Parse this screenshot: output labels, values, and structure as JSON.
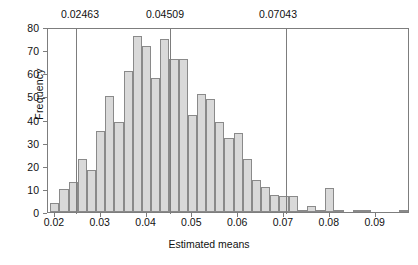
{
  "chart_data": {
    "type": "bar",
    "title": "",
    "xlabel": "Estimated means",
    "ylabel": "Frequency",
    "xlim": [
      0.0185,
      0.0975
    ],
    "ylim": [
      0,
      80
    ],
    "grid": false,
    "legend": null,
    "bin_width": 0.002,
    "x_ticks": [
      "0.02",
      "0.03",
      "0.04",
      "0.05",
      "0.06",
      "0.07",
      "0.08",
      "0.09"
    ],
    "x_tick_values": [
      0.02,
      0.03,
      0.04,
      0.05,
      0.06,
      0.07,
      0.08,
      0.09
    ],
    "y_ticks": [
      "0",
      "10",
      "20",
      "30",
      "40",
      "50",
      "60",
      "70",
      "80"
    ],
    "y_tick_values": [
      0,
      10,
      20,
      30,
      40,
      50,
      60,
      70,
      80
    ],
    "bin_left_edges": [
      0.019,
      0.021,
      0.023,
      0.025,
      0.027,
      0.029,
      0.031,
      0.033,
      0.035,
      0.037,
      0.039,
      0.041,
      0.043,
      0.045,
      0.047,
      0.049,
      0.051,
      0.053,
      0.055,
      0.057,
      0.059,
      0.061,
      0.063,
      0.065,
      0.067,
      0.069,
      0.071,
      0.073,
      0.075,
      0.077,
      0.079,
      0.081,
      0.083,
      0.085,
      0.087,
      0.089,
      0.091,
      0.093,
      0.095
    ],
    "values": [
      4,
      10,
      13,
      23,
      18,
      35,
      50,
      39,
      61,
      76,
      72,
      58,
      75,
      66,
      66,
      42,
      51,
      49,
      39,
      32,
      34,
      23,
      14,
      11,
      7.5,
      7,
      7,
      1,
      2.5,
      1,
      10.5,
      1,
      0,
      1,
      1,
      0,
      0,
      0,
      1
    ],
    "annotations": [
      {
        "label": "0.02463",
        "value": 0.02463,
        "type": "vertical-line"
      },
      {
        "label": "0.04509",
        "value": 0.04509,
        "type": "vertical-line"
      },
      {
        "label": "0.07043",
        "value": 0.07043,
        "type": "vertical-line"
      }
    ],
    "colors": {
      "bar_fill": "#d9d9d9",
      "bar_edge": "#8a8a8a",
      "axis": "#7d7d7d",
      "annotation_line": "#7d7d7d",
      "text": "#111111",
      "background": "#ffffff"
    }
  },
  "axes": {
    "y_label": "Frequency",
    "x_label": "Estimated means",
    "y_tick_labels": [
      "80",
      "70",
      "60",
      "50",
      "40",
      "30",
      "20",
      "10",
      "0"
    ],
    "x_tick_labels": [
      "0.02",
      "0.03",
      "0.04",
      "0.05",
      "0.06",
      "0.07",
      "0.08",
      "0.09"
    ]
  },
  "annotation_labels": [
    "0.02463",
    "0.04509",
    "0.07043"
  ]
}
